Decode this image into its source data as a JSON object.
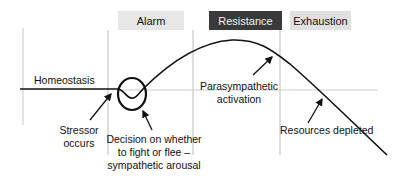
{
  "diagram": {
    "phases": [
      {
        "label": "Alarm",
        "style": "light"
      },
      {
        "label": "Resistance",
        "style": "dark"
      },
      {
        "label": "Exhaustion",
        "style": "light"
      }
    ],
    "annotations": {
      "homeostasis": "Homeostasis",
      "stressor": "Stressor occurs",
      "decision": "Decision on whether to fight or flee – sympathetic arousal",
      "parasympathetic": "Parasympathetic activation",
      "resources": "Resources depleted"
    },
    "colors": {
      "curve": "#111111",
      "baseline": "#cccccc",
      "divider": "#bbbbbb",
      "alarm_box": "#e6e6e6",
      "resistance_box": "#3a3a3a",
      "exhaustion_box": "#e0e0e0"
    }
  }
}
